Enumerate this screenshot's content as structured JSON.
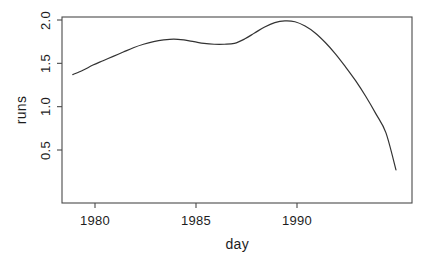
{
  "chart_data": {
    "type": "line",
    "title": "",
    "subtitle": "",
    "xlabel": "day",
    "ylabel": "runs",
    "xlim": [
      1978.4,
      1995.2
    ],
    "ylim": [
      0.18,
      2.13
    ],
    "grid": false,
    "legend": false,
    "legend_position": "none",
    "line_color": "#333333",
    "line_width": 1.2,
    "background": "#ffffff",
    "axis_color": "#4a4a4a",
    "xticks": [
      1980,
      1985,
      1990
    ],
    "xtick_labels": [
      "1980",
      "1985",
      "1990"
    ],
    "yticks": [
      0.5,
      1.0,
      1.5,
      2.0
    ],
    "ytick_labels": [
      "0.5",
      "1.0",
      "1.5",
      "2.0"
    ],
    "series": [
      {
        "name": "runs",
        "x": [
          1978.9,
          1979.4,
          1979.9,
          1980.4,
          1980.9,
          1981.4,
          1981.9,
          1982.4,
          1982.9,
          1983.4,
          1983.9,
          1984.4,
          1984.9,
          1985.4,
          1985.9,
          1986.4,
          1986.9,
          1987.4,
          1987.9,
          1988.4,
          1988.9,
          1989.4,
          1989.9,
          1990.4,
          1990.9,
          1991.4,
          1991.9,
          1992.4,
          1992.9,
          1993.4,
          1993.9,
          1994.4,
          1994.9
        ],
        "values": [
          1.37,
          1.42,
          1.48,
          1.53,
          1.58,
          1.63,
          1.68,
          1.72,
          1.75,
          1.77,
          1.78,
          1.77,
          1.75,
          1.73,
          1.72,
          1.72,
          1.73,
          1.78,
          1.85,
          1.92,
          1.97,
          1.99,
          1.98,
          1.93,
          1.85,
          1.74,
          1.61,
          1.46,
          1.3,
          1.12,
          0.92,
          0.7,
          0.27
        ]
      }
    ]
  },
  "figure": {
    "ylabel_text": "runs",
    "xlabel_text": "day"
  }
}
